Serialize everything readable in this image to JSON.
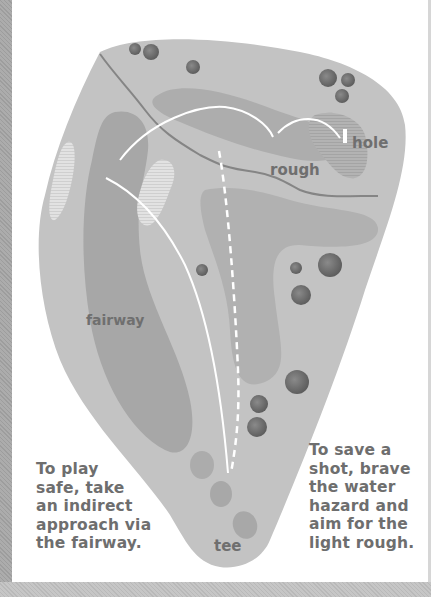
{
  "diagram": {
    "type": "golf-hole-strategy-map",
    "labels": {
      "hole": "hole",
      "rough": "rough",
      "fairway": "fairway",
      "tee": "tee"
    },
    "captions": {
      "left": "To play\nsafe, take\nan indirect\napproach via\nthe fairway.",
      "right": "To save a\nshot, brave\nthe water\nhazard and\naim for the\nlight rough."
    },
    "routes": [
      {
        "name": "safe-route",
        "style": "solid",
        "description": "indirect approach via the fairway"
      },
      {
        "name": "aggressive-route",
        "style": "dashed",
        "description": "over the water hazard to the light rough"
      }
    ],
    "colors": {
      "course_background": "#c3c3c3",
      "fairway": "#a7a7a7",
      "rough": "#adadad",
      "bunker": "#dedede",
      "green": "#b3b3b3",
      "trees": "#717171",
      "water": "#8a8a8a",
      "route_line": "#ffffff",
      "text": "#6e6e6e"
    }
  }
}
